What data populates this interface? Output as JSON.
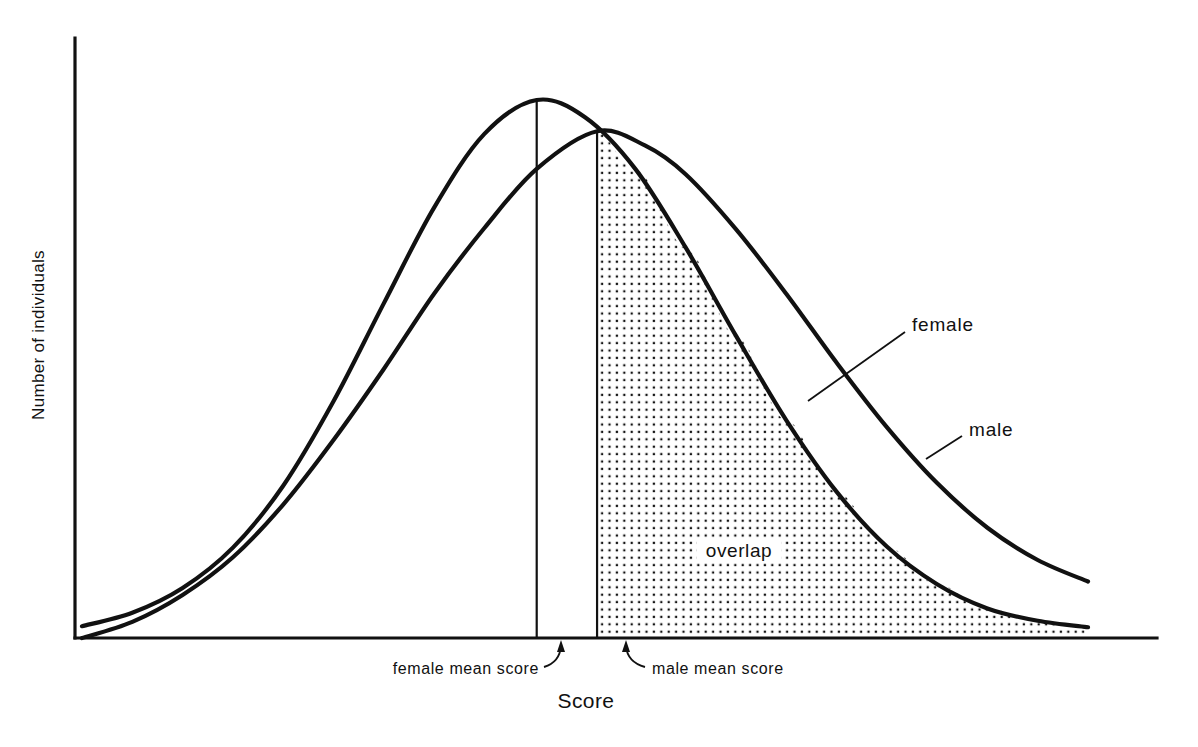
{
  "chart_data": {
    "type": "line",
    "title": "",
    "subtitle": "",
    "xlabel": "Score",
    "ylabel": "Number of individuals",
    "grid": false,
    "axis_ticks": false,
    "legend_position": "inline-callout-right",
    "series": [
      {
        "name": "female",
        "label": "female",
        "mean_label": "female mean score",
        "peak_height": 1.0,
        "mean_x": 0.452,
        "std": 0.155,
        "description": "Taller, narrower normal curve shifted left; peak marked by a vertical line down to the axis.",
        "x": [
          0.0,
          0.05,
          0.1,
          0.15,
          0.2,
          0.25,
          0.3,
          0.35,
          0.4,
          0.452,
          0.5,
          0.55,
          0.6,
          0.65,
          0.7,
          0.75,
          0.8,
          0.85,
          0.9,
          0.95,
          1.0
        ],
        "y": [
          0.022,
          0.047,
          0.093,
          0.168,
          0.283,
          0.44,
          0.622,
          0.8,
          0.937,
          1.0,
          0.968,
          0.872,
          0.726,
          0.562,
          0.405,
          0.272,
          0.17,
          0.1,
          0.055,
          0.032,
          0.02
        ]
      },
      {
        "name": "male",
        "label": "male",
        "mean_label": "male mean score",
        "peak_height": 0.942,
        "mean_x": 0.512,
        "std": 0.2,
        "description": "Lower, broader normal curve shifted right with a heavier right tail.",
        "x": [
          0.0,
          0.05,
          0.1,
          0.15,
          0.2,
          0.25,
          0.3,
          0.35,
          0.4,
          0.452,
          0.512,
          0.56,
          0.6,
          0.65,
          0.7,
          0.75,
          0.8,
          0.85,
          0.9,
          0.95,
          1.0
        ],
        "y": [
          0.0,
          0.03,
          0.08,
          0.15,
          0.248,
          0.368,
          0.5,
          0.64,
          0.762,
          0.872,
          0.942,
          0.915,
          0.862,
          0.76,
          0.64,
          0.512,
          0.392,
          0.288,
          0.205,
          0.145,
          0.105
        ]
      }
    ],
    "regions": [
      {
        "name": "overlap",
        "label": "overlap",
        "fill": "stipple-dots",
        "starts_at_x": 0.512,
        "description": "Stippled area under the lower of the two curves, to the right of the male mean score."
      }
    ],
    "annotations": [
      {
        "name": "female-mean-annotation",
        "text": "female mean score",
        "points_to": "female mean vertical line at the axis"
      },
      {
        "name": "male-mean-annotation",
        "text": "male mean score",
        "points_to": "male mean vertical line at the axis"
      },
      {
        "name": "female-series-callout",
        "text": "female",
        "points_to": "female distribution curve"
      },
      {
        "name": "male-series-callout",
        "text": "male",
        "points_to": "male distribution curve"
      },
      {
        "name": "overlap-region-label",
        "text": "overlap",
        "points_to": "stippled overlap area"
      }
    ],
    "colors": {
      "ink": "#111111",
      "background": "#ffffff",
      "stipple": "#111111"
    }
  },
  "axes": {
    "x_title": "Score",
    "y_title": "Number of individuals"
  },
  "labels": {
    "female_series": "female",
    "male_series": "male",
    "overlap": "overlap",
    "female_mean": "female mean score",
    "male_mean": "male mean score"
  }
}
